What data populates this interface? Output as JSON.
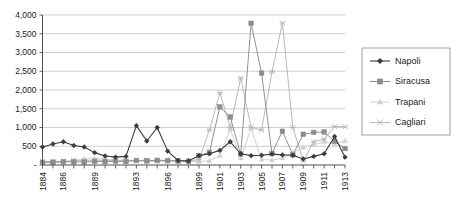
{
  "chart_data": {
    "type": "line",
    "title": "",
    "subtitle": "",
    "xlabel": "",
    "ylabel": "",
    "grid": true,
    "legend_position": "right",
    "ylim": [
      0,
      4000
    ],
    "ytick_labels": [
      "-",
      "500",
      "1,000",
      "1,500",
      "2,000",
      "2,500",
      "3,000",
      "3,500",
      "4,000"
    ],
    "ytick_values": [
      0,
      500,
      1000,
      1500,
      2000,
      2500,
      3000,
      3500,
      4000
    ],
    "x": [
      1884,
      1885,
      1886,
      1887,
      1888,
      1889,
      1890,
      1891,
      1892,
      1893,
      1894,
      1895,
      1896,
      1897,
      1898,
      1899,
      1900,
      1901,
      1902,
      1903,
      1904,
      1905,
      1906,
      1907,
      1908,
      1909,
      1910,
      1911,
      1912,
      1913
    ],
    "xtick_labels": [
      "1884",
      "1886",
      "1889",
      "1893",
      "1896",
      "1899",
      "1901",
      "1903",
      "1905",
      "1907",
      "1909",
      "1911",
      "1913"
    ],
    "xtick_label_values": [
      1884,
      1886,
      1889,
      1893,
      1896,
      1899,
      1901,
      1903,
      1905,
      1907,
      1909,
      1911,
      1913
    ],
    "series": [
      {
        "name": "Napoli",
        "color": "#3b3b3b",
        "marker": "diamond",
        "values": [
          480,
          560,
          620,
          520,
          480,
          330,
          240,
          210,
          230,
          1050,
          640,
          1000,
          370,
          120,
          110,
          250,
          300,
          390,
          620,
          300,
          250,
          260,
          290,
          270,
          260,
          160,
          230,
          300,
          760,
          210
        ]
      },
      {
        "name": "Siracusa",
        "color": "#8c8c8c",
        "marker": "square",
        "values": [
          70,
          75,
          90,
          85,
          80,
          95,
          90,
          100,
          95,
          120,
          110,
          125,
          120,
          110,
          100,
          250,
          340,
          1550,
          1280,
          290,
          3780,
          2450,
          310,
          900,
          270,
          820,
          870,
          880,
          630,
          440
        ]
      },
      {
        "name": "Trapani",
        "color": "#cfcfcf",
        "marker": "triangle",
        "values": [
          60,
          65,
          70,
          130,
          160,
          175,
          160,
          140,
          120,
          110,
          100,
          95,
          90,
          85,
          80,
          90,
          110,
          250,
          960,
          180,
          980,
          150,
          130,
          180,
          330,
          470,
          540,
          620,
          560,
          640
        ]
      },
      {
        "name": "Cagliari",
        "color": "#b5b5b5",
        "marker": "star",
        "values": [
          90,
          95,
          100,
          110,
          120,
          130,
          120,
          115,
          110,
          120,
          130,
          125,
          120,
          115,
          110,
          140,
          930,
          1930,
          1000,
          2320,
          1010,
          930,
          2480,
          3790,
          1000,
          110,
          620,
          690,
          1030,
          1020
        ]
      }
    ]
  },
  "legend": {
    "items": [
      {
        "label": "Napoli"
      },
      {
        "label": "Siracusa"
      },
      {
        "label": "Trapani"
      },
      {
        "label": "Cagliari"
      }
    ]
  }
}
